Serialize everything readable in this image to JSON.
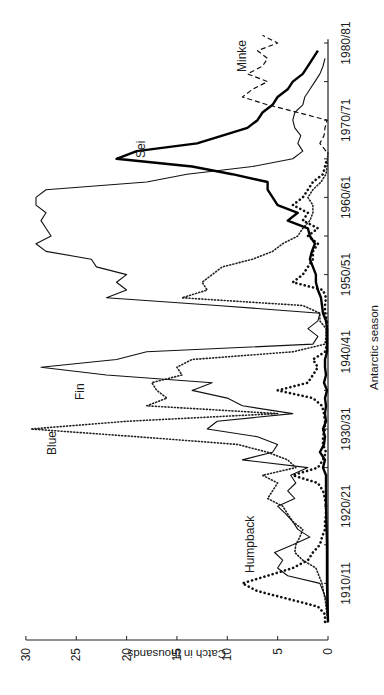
{
  "chart_data": {
    "type": "line",
    "title": "",
    "xlabel": "Antarctic season",
    "ylabel": "Catch in thousands",
    "orientation": "rotated 90° (season axis vertical on right, catch axis horizontal on bottom, read sideways)",
    "ylim": [
      0,
      30
    ],
    "xlim": [
      1905,
      1981
    ],
    "y_ticks": [
      0,
      5,
      10,
      15,
      20,
      25,
      30
    ],
    "y_tick_labels": [
      "0",
      "5",
      "10",
      "15",
      "20",
      "25",
      "30"
    ],
    "x_ticks": [
      1905,
      1910,
      1915,
      1920,
      1925,
      1930,
      1935,
      1940,
      1945,
      1950,
      1955,
      1960,
      1965,
      1970,
      1975,
      1980
    ],
    "x_tick_labels": [
      {
        "value": 1910,
        "label": "1910/11"
      },
      {
        "value": 1920,
        "label": "1920/21"
      },
      {
        "value": 1930,
        "label": "1930/31"
      },
      {
        "value": 1940,
        "label": "1940/41"
      },
      {
        "value": 1950,
        "label": "1950/51"
      },
      {
        "value": 1960,
        "label": "1960/61"
      },
      {
        "value": 1970,
        "label": "1970/71"
      },
      {
        "value": 1980,
        "label": "1980/81"
      }
    ],
    "grid": false,
    "legend": "inline labels",
    "series": [
      {
        "name": "Blue",
        "style": "fine-dotted",
        "points": [
          [
            1905,
            0
          ],
          [
            1908,
            0.3
          ],
          [
            1910,
            0.6
          ],
          [
            1912,
            1.2
          ],
          [
            1913,
            2.5
          ],
          [
            1914,
            3.3
          ],
          [
            1915,
            3.2
          ],
          [
            1916,
            2.8
          ],
          [
            1917,
            2.5
          ],
          [
            1918,
            3.5
          ],
          [
            1919,
            4.0
          ],
          [
            1920,
            4.5
          ],
          [
            1921,
            6.0
          ],
          [
            1922,
            5.5
          ],
          [
            1923,
            5.0
          ],
          [
            1924,
            6.5
          ],
          [
            1925,
            3.2
          ],
          [
            1926,
            4.0
          ],
          [
            1927,
            6.0
          ],
          [
            1928,
            9.0
          ],
          [
            1929,
            19.0
          ],
          [
            1930,
            29.5
          ],
          [
            1931,
            20.0
          ],
          [
            1932,
            5.0
          ],
          [
            1933,
            18.0
          ],
          [
            1934,
            16.0
          ],
          [
            1935,
            17.0
          ],
          [
            1936,
            17.5
          ],
          [
            1937,
            14.5
          ],
          [
            1938,
            15.0
          ],
          [
            1939,
            13.5
          ],
          [
            1940,
            3.5
          ],
          [
            1941,
            0.3
          ],
          [
            1942,
            0.2
          ],
          [
            1943,
            0.2
          ],
          [
            1944,
            0.8
          ],
          [
            1945,
            0.8
          ],
          [
            1946,
            2.5
          ],
          [
            1947,
            14.5
          ],
          [
            1948,
            12.0
          ],
          [
            1949,
            12.5
          ],
          [
            1950,
            11.5
          ],
          [
            1951,
            10.5
          ],
          [
            1952,
            7.5
          ],
          [
            1953,
            5.5
          ],
          [
            1954,
            4.5
          ],
          [
            1955,
            3.0
          ],
          [
            1956,
            2.5
          ],
          [
            1957,
            1.8
          ],
          [
            1958,
            1.5
          ],
          [
            1959,
            1.5
          ],
          [
            1960,
            2.0
          ],
          [
            1961,
            1.5
          ],
          [
            1962,
            0.7
          ],
          [
            1963,
            0.2
          ],
          [
            1964,
            0.1
          ],
          [
            1965,
            0.05
          ],
          [
            1966,
            0.0
          ]
        ]
      },
      {
        "name": "Fin",
        "style": "thin-solid",
        "points": [
          [
            1905,
            0
          ],
          [
            1908,
            0.2
          ],
          [
            1910,
            0.8
          ],
          [
            1911,
            4.0
          ],
          [
            1912,
            5.0
          ],
          [
            1913,
            4.5
          ],
          [
            1914,
            5.3
          ],
          [
            1915,
            3.5
          ],
          [
            1916,
            1.8
          ],
          [
            1917,
            3.0
          ],
          [
            1918,
            3.5
          ],
          [
            1919,
            4.2
          ],
          [
            1920,
            5.0
          ],
          [
            1921,
            3.3
          ],
          [
            1922,
            4.0
          ],
          [
            1923,
            3.2
          ],
          [
            1924,
            3.7
          ],
          [
            1925,
            2.0
          ],
          [
            1926,
            8.5
          ],
          [
            1927,
            5.5
          ],
          [
            1928,
            5.0
          ],
          [
            1929,
            7.0
          ],
          [
            1930,
            12.0
          ],
          [
            1931,
            11.0
          ],
          [
            1932,
            3.5
          ],
          [
            1933,
            8.5
          ],
          [
            1934,
            10.0
          ],
          [
            1935,
            13.5
          ],
          [
            1936,
            11.5
          ],
          [
            1937,
            22.0
          ],
          [
            1938,
            28.5
          ],
          [
            1939,
            21.0
          ],
          [
            1940,
            18.0
          ],
          [
            1941,
            1.5
          ],
          [
            1942,
            1.0
          ],
          [
            1943,
            2.0
          ],
          [
            1944,
            1.0
          ],
          [
            1945,
            0.8
          ],
          [
            1946,
            11.0
          ],
          [
            1947,
            22.0
          ],
          [
            1948,
            20.0
          ],
          [
            1949,
            21.0
          ],
          [
            1950,
            20.0
          ],
          [
            1951,
            23.0
          ],
          [
            1952,
            23.5
          ],
          [
            1953,
            28.0
          ],
          [
            1954,
            29.0
          ],
          [
            1955,
            27.5
          ],
          [
            1956,
            28.0
          ],
          [
            1957,
            28.5
          ],
          [
            1958,
            28.0
          ],
          [
            1959,
            29.0
          ],
          [
            1960,
            29.0
          ],
          [
            1961,
            28.0
          ],
          [
            1962,
            18.0
          ],
          [
            1963,
            14.0
          ],
          [
            1964,
            7.5
          ],
          [
            1965,
            3.5
          ],
          [
            1966,
            2.5
          ],
          [
            1967,
            3.0
          ],
          [
            1968,
            2.7
          ],
          [
            1969,
            3.3
          ],
          [
            1970,
            3.5
          ],
          [
            1971,
            3.3
          ],
          [
            1972,
            2.5
          ],
          [
            1973,
            2.3
          ],
          [
            1974,
            1.8
          ],
          [
            1975,
            1.3
          ],
          [
            1976,
            0.8
          ],
          [
            1977,
            0.5
          ],
          [
            1978,
            0.3
          ]
        ]
      },
      {
        "name": "Humpback",
        "style": "heavy-dotted",
        "points": [
          [
            1905,
            0.3
          ],
          [
            1906,
            0.3
          ],
          [
            1907,
            1.0
          ],
          [
            1908,
            4.0
          ],
          [
            1909,
            7.0
          ],
          [
            1910,
            8.5
          ],
          [
            1911,
            6.0
          ],
          [
            1912,
            3.5
          ],
          [
            1913,
            2.0
          ],
          [
            1914,
            1.5
          ],
          [
            1915,
            0.8
          ],
          [
            1916,
            0.6
          ],
          [
            1917,
            0.3
          ],
          [
            1918,
            0.3
          ],
          [
            1919,
            0.2
          ],
          [
            1920,
            0.2
          ],
          [
            1921,
            0.3
          ],
          [
            1922,
            0.5
          ],
          [
            1923,
            1.0
          ],
          [
            1924,
            3.5
          ],
          [
            1925,
            1.0
          ],
          [
            1926,
            0.5
          ],
          [
            1927,
            0.2
          ],
          [
            1928,
            0.5
          ],
          [
            1929,
            0.5
          ],
          [
            1930,
            0.3
          ],
          [
            1931,
            0.3
          ],
          [
            1932,
            0.4
          ],
          [
            1933,
            0.6
          ],
          [
            1934,
            1.5
          ],
          [
            1935,
            5.0
          ],
          [
            1936,
            2.0
          ],
          [
            1937,
            1.5
          ],
          [
            1938,
            1.0
          ],
          [
            1939,
            1.5
          ],
          [
            1940,
            0.3
          ],
          [
            1941,
            0.1
          ],
          [
            1942,
            0.1
          ],
          [
            1943,
            0.1
          ],
          [
            1944,
            0.1
          ],
          [
            1945,
            0.3
          ],
          [
            1946,
            0.3
          ],
          [
            1947,
            0.2
          ],
          [
            1948,
            0.5
          ],
          [
            1949,
            3.5
          ],
          [
            1950,
            2.5
          ],
          [
            1951,
            2.0
          ],
          [
            1952,
            1.5
          ],
          [
            1953,
            1.5
          ],
          [
            1954,
            1.0
          ],
          [
            1955,
            2.0
          ],
          [
            1956,
            1.0
          ],
          [
            1957,
            2.5
          ],
          [
            1958,
            2.0
          ],
          [
            1959,
            3.5
          ],
          [
            1960,
            2.5
          ],
          [
            1961,
            2.0
          ],
          [
            1962,
            1.5
          ],
          [
            1963,
            0.5
          ],
          [
            1964,
            0.3
          ],
          [
            1965,
            0.1
          ]
        ]
      },
      {
        "name": "Sei",
        "style": "thick-solid",
        "points": [
          [
            1905,
            0
          ],
          [
            1910,
            0.1
          ],
          [
            1915,
            0.1
          ],
          [
            1920,
            0.2
          ],
          [
            1924,
            0.2
          ],
          [
            1925,
            0.5
          ],
          [
            1926,
            0.3
          ],
          [
            1927,
            0.8
          ],
          [
            1928,
            0.4
          ],
          [
            1929,
            0.3
          ],
          [
            1930,
            0.5
          ],
          [
            1931,
            0.2
          ],
          [
            1932,
            0.3
          ],
          [
            1933,
            0.2
          ],
          [
            1934,
            0.3
          ],
          [
            1935,
            0.1
          ],
          [
            1936,
            0.4
          ],
          [
            1937,
            0.2
          ],
          [
            1938,
            0.3
          ],
          [
            1939,
            0.3
          ],
          [
            1940,
            0.1
          ],
          [
            1941,
            0.1
          ],
          [
            1942,
            0.1
          ],
          [
            1943,
            0.1
          ],
          [
            1944,
            0.2
          ],
          [
            1945,
            0.5
          ],
          [
            1946,
            0.6
          ],
          [
            1947,
            0.7
          ],
          [
            1948,
            1.0
          ],
          [
            1949,
            1.2
          ],
          [
            1950,
            1.2
          ],
          [
            1951,
            1.5
          ],
          [
            1952,
            1.8
          ],
          [
            1953,
            1.6
          ],
          [
            1954,
            1.3
          ],
          [
            1955,
            1.8
          ],
          [
            1956,
            2.0
          ],
          [
            1957,
            4.0
          ],
          [
            1958,
            3.0
          ],
          [
            1959,
            5.0
          ],
          [
            1960,
            5.5
          ],
          [
            1961,
            6.0
          ],
          [
            1962,
            6.0
          ],
          [
            1963,
            9.5
          ],
          [
            1964,
            13.5
          ],
          [
            1965,
            21.0
          ],
          [
            1966,
            19.0
          ],
          [
            1967,
            13.0
          ],
          [
            1968,
            10.5
          ],
          [
            1969,
            8.0
          ],
          [
            1970,
            7.0
          ],
          [
            1971,
            6.5
          ],
          [
            1972,
            5.5
          ],
          [
            1973,
            5.0
          ],
          [
            1974,
            4.0
          ],
          [
            1975,
            3.5
          ],
          [
            1976,
            2.5
          ],
          [
            1977,
            2.0
          ],
          [
            1978,
            1.5
          ],
          [
            1979,
            1.0
          ]
        ]
      },
      {
        "name": "Minke",
        "style": "dashed",
        "points": [
          [
            1966,
            0.2
          ],
          [
            1967,
            0.8
          ],
          [
            1968,
            0.4
          ],
          [
            1969,
            0.3
          ],
          [
            1970,
            0.1
          ],
          [
            1971,
            3.0
          ],
          [
            1972,
            6.0
          ],
          [
            1973,
            8.5
          ],
          [
            1974,
            7.5
          ],
          [
            1975,
            6.0
          ],
          [
            1976,
            8.0
          ],
          [
            1977,
            6.5
          ],
          [
            1978,
            6.0
          ],
          [
            1979,
            7.0
          ],
          [
            1980,
            5.0
          ],
          [
            1981,
            6.5
          ]
        ]
      }
    ]
  },
  "labels": {
    "blue": "Blue",
    "fin": "Fin",
    "humpback": "Humpback",
    "sei": "Sei",
    "minke": "Minke",
    "xlabel": "Antarctic season",
    "ylabel": "Catch in thousands"
  }
}
